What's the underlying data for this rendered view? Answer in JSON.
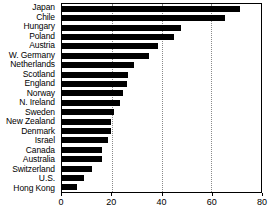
{
  "chart_data": {
    "type": "bar",
    "orientation": "horizontal",
    "title": "",
    "subtitle": "",
    "xlabel": "",
    "ylabel": "",
    "xlim": [
      0,
      80
    ],
    "ylim": null,
    "grid": "vertical-dotted",
    "legend": null,
    "legend_position": "none",
    "xticks": [
      0,
      20,
      40,
      60,
      80
    ],
    "xticklabels": [
      "0",
      "20",
      "40",
      "60",
      "80"
    ],
    "bar_color": "#000000",
    "categories": [
      "Japan",
      "Chile",
      "Hungary",
      "Poland",
      "Austria",
      "W. Germany",
      "Netherlands",
      "Scotland",
      "England",
      "Norway",
      "N. Ireland",
      "Sweden",
      "New Zealand",
      "Denmark",
      "Israel",
      "Canada",
      "Australia",
      "Switzerland",
      "U.S.",
      "Hong Kong"
    ],
    "values": [
      71.5,
      65.5,
      48.0,
      45.0,
      38.5,
      35.0,
      29.0,
      26.5,
      26.0,
      24.5,
      23.5,
      21.0,
      19.5,
      19.5,
      18.5,
      16.0,
      16.0,
      12.0,
      9.0,
      6.0
    ]
  }
}
